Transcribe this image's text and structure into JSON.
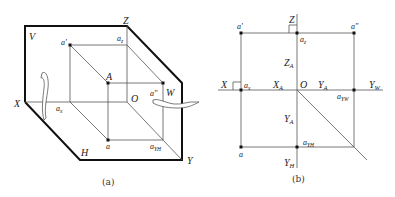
{
  "figure_a": {
    "caption": "(a)",
    "planes": {
      "V": "V",
      "H": "H",
      "W": "W"
    },
    "axes": {
      "X": "X",
      "Y": "Y",
      "Z": "Z",
      "origin": "O"
    },
    "points": {
      "A": "A",
      "a_prime": "a'",
      "a_double_prime": "a\"",
      "a": "a",
      "a_z": "a",
      "a_z_sub": "z",
      "a_x": "a",
      "a_x_sub": "x",
      "a_YH": "a",
      "a_YH_sub": "YH"
    }
  },
  "figure_b": {
    "caption": "(b)",
    "axes": {
      "X": "X",
      "Z": "Z",
      "origin": "O",
      "Y_W": "Y",
      "Y_W_sub": "W",
      "Y_H": "Y",
      "Y_H_sub": "H"
    },
    "points": {
      "a_prime": "a'",
      "a_double_prime": "a\"",
      "a": "a",
      "a_z": "a",
      "a_z_sub": "z",
      "a_x": "a",
      "a_x_sub": "x",
      "a_YW": "a",
      "a_YW_sub": "YW",
      "a_YH": "a",
      "a_YH_sub": "YH"
    },
    "distances": {
      "Z_A": "Z",
      "Z_A_sub": "A",
      "X_A": "X",
      "X_A_sub": "A",
      "Y_A_horizontal": "Y",
      "Y_A_horizontal_sub": "A",
      "Y_A_vertical": "Y",
      "Y_A_vertical_sub": "A"
    }
  }
}
